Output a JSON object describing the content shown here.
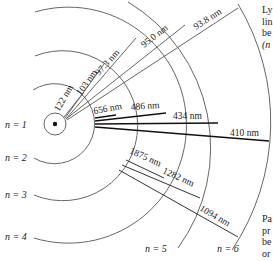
{
  "diagram": {
    "levels": [
      {
        "label": "n = 1"
      },
      {
        "label": "n = 2"
      },
      {
        "label": "n = 3"
      },
      {
        "label": "n = 4"
      },
      {
        "label": "n = 5"
      },
      {
        "label": "n = 6"
      }
    ],
    "lyman_series": {
      "wavelengths": [
        "122 nm",
        "103 nm",
        "97.3 nm",
        "95.0 nm",
        "93.8 nm"
      ],
      "caption_lines": [
        "Ly",
        "lin",
        "be",
        "(n"
      ]
    },
    "balmer_series": {
      "wavelengths": [
        "656 nm",
        "486 nm",
        "434 nm",
        "410 nm"
      ]
    },
    "paschen_series": {
      "wavelengths": [
        "1875 nm",
        "1282 nm",
        "1094 nm"
      ],
      "caption_lines": [
        "Pa",
        "pr",
        "be",
        "or"
      ]
    }
  }
}
